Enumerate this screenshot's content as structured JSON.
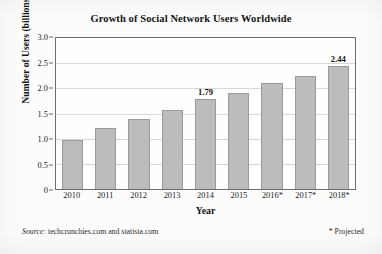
{
  "chart_data": {
    "type": "bar",
    "title": "Growth of Social Network Users Worldwide",
    "xlabel": "Year",
    "ylabel": "Number of Users (billions)",
    "categories": [
      "2010",
      "2011",
      "2012",
      "2013",
      "2014",
      "2015",
      "2016*",
      "2017*",
      "2018*"
    ],
    "values": [
      0.97,
      1.22,
      1.39,
      1.57,
      1.79,
      1.91,
      2.1,
      2.24,
      2.44
    ],
    "value_labels": [
      "",
      "",
      "",
      "",
      "1.79",
      "",
      "",
      "",
      "2.44"
    ],
    "ylim": [
      0,
      3.0
    ],
    "yticks": [
      "0",
      "0.5",
      "1.0",
      "1.5",
      "2.0",
      "2.5",
      "3.0"
    ],
    "ytick_values": [
      0,
      0.5,
      1.0,
      1.5,
      2.0,
      2.5,
      3.0
    ],
    "grid": true,
    "legend": "none",
    "bar_color": "#bcbcbc",
    "bar_edge_color": "#9a9a9a",
    "axis_color": "#6d6d6d",
    "grid_color": "#d8d8d8"
  },
  "footer": {
    "source_label": "Source:",
    "source_text": "techcrunchies.com and statista.com",
    "projected_note": "* Projected"
  }
}
